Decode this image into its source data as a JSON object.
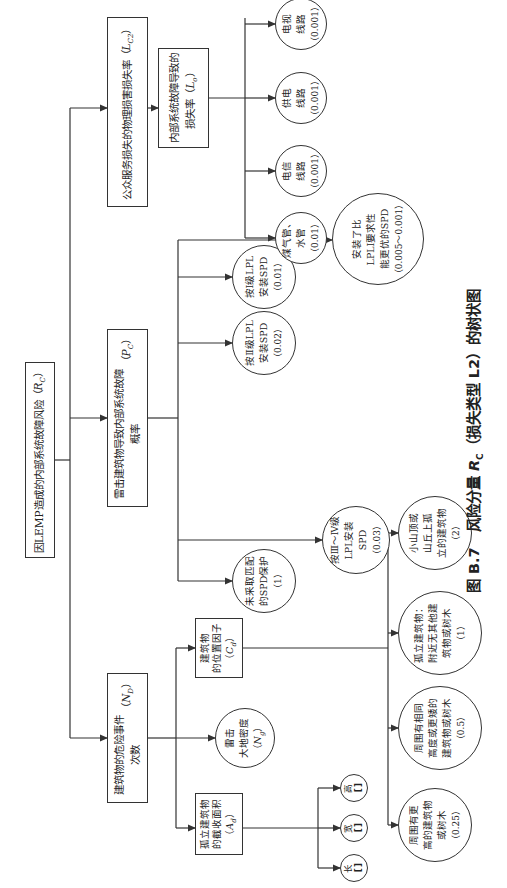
{
  "root": {
    "label": "因LEMP造成的内部系统故障风险",
    "symbol": "R",
    "subscript": "C"
  },
  "level1": [
    {
      "label": "建筑物的危险事件次数",
      "symbol": "N",
      "subscript": "D"
    },
    {
      "label": "雷击建筑物导致内部系统故障概率",
      "symbol": "P",
      "subscript": "C"
    },
    {
      "label": "公众服务损失的物理损害损失率",
      "symbol": "L",
      "subscript": "C2"
    }
  ],
  "nd_children": {
    "area_box": {
      "line1": "孤立建筑物",
      "line2": "的截收面积",
      "symbol": "A",
      "subscript": "d"
    },
    "density_circle": {
      "line1": "雷击",
      "line2": "大地密度",
      "symbol": "N",
      "subscript": "g"
    },
    "location_box": {
      "line1": "建筑物",
      "line2": "的位置因子",
      "symbol": "C",
      "subscript": "d"
    }
  },
  "dimensions": [
    {
      "label": "长",
      "value": "[ ]"
    },
    {
      "label": "宽",
      "value": "[ ]"
    },
    {
      "label": "高",
      "value": "[ ]"
    }
  ],
  "location_factors": [
    {
      "lines": [
        "周围有更",
        "高的建筑物",
        "或树木"
      ],
      "value": "（0.25）"
    },
    {
      "lines": [
        "周围有相同",
        "高度或更矮的",
        "建筑物或树木"
      ],
      "value": "（0.5）"
    },
    {
      "lines": [
        "孤立建筑物：",
        "附近无其他建",
        "筑物或树木"
      ],
      "value": "（1）"
    },
    {
      "lines": [
        "小山顶或",
        "山丘上孤",
        "立的建筑物"
      ],
      "value": "（2）"
    }
  ],
  "pc_children": [
    {
      "lines": [
        "未采取匹配",
        "的SPD保护"
      ],
      "value": "（1）"
    },
    {
      "lines": [
        "按Ⅲ～Ⅳ级",
        "LPL安装SPD"
      ],
      "value": "（0.03）"
    },
    {
      "lines": [
        "按Ⅱ级LPL",
        "安装SPD"
      ],
      "value": "（0.02）"
    },
    {
      "lines": [
        "按Ⅰ级LPL",
        "安装SPD"
      ],
      "value": "（0.01）"
    },
    {
      "lines": [
        "安装了比",
        "LPLⅠ要求性",
        "能更优的SPD"
      ],
      "value": "（0.005～0.001）"
    }
  ],
  "lc2_child": {
    "line1": "内部系统故障导致的",
    "line2": "损失率",
    "symbol": "L",
    "subscript": "o"
  },
  "lo_children": [
    {
      "lines": [
        "煤气管、",
        "水管"
      ],
      "value": "（0.01）"
    },
    {
      "lines": [
        "电信",
        "线路"
      ],
      "value": "（0.001）"
    },
    {
      "lines": [
        "供电",
        "线路"
      ],
      "value": "（0.001）"
    },
    {
      "lines": [
        "电视",
        "线路"
      ],
      "value": "（0.001）"
    }
  ],
  "caption": {
    "prefix": "图 B.7",
    "text1": "风险分量 ",
    "symbol": "R",
    "subscript": "C",
    "text2": "（损失类型 L2）的树状图"
  },
  "colors": {
    "line": "#333333",
    "text": "#222222",
    "background": "#ffffff"
  }
}
